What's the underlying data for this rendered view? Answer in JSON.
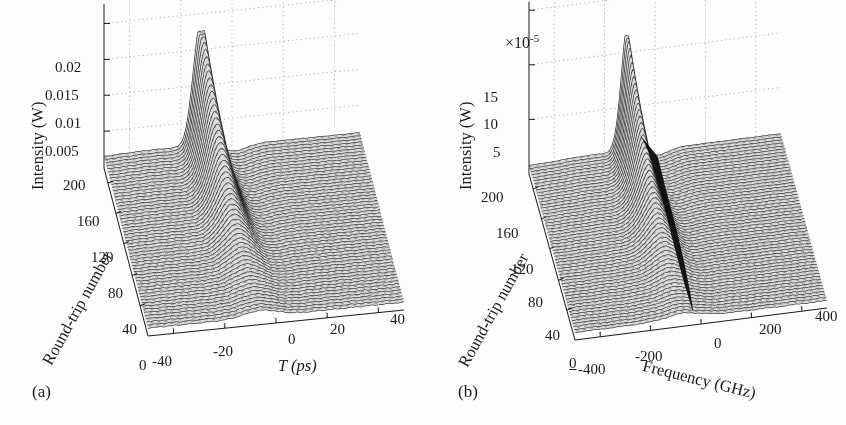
{
  "figure": {
    "background": "#fdfdfc",
    "ink": "#1a1a1a",
    "width": 846,
    "height": 425
  },
  "panels": [
    {
      "tag": "(a)",
      "multiplier": "",
      "zaxis": {
        "title": "Intensity (W)",
        "ticks": [
          "0.02",
          "0.015",
          "0.01",
          "0.005"
        ],
        "tick_values": [
          0.02,
          0.015,
          0.01,
          0.005
        ],
        "min": 0,
        "max": 0.0225
      },
      "depth_axis": {
        "title": "Round-trip number",
        "ticks": [
          "200",
          "160",
          "120",
          "80",
          "40"
        ],
        "tick_values": [
          200,
          160,
          120,
          80,
          40
        ],
        "origin_label": "0",
        "min": 0,
        "max": 220
      },
      "xaxis": {
        "title": "T (ps)",
        "ticks": [
          "-40",
          "-20",
          "0",
          "20",
          "40"
        ],
        "tick_values": [
          -40,
          -20,
          0,
          20,
          40
        ],
        "min": -50,
        "max": 50
      }
    },
    {
      "tag": "(b)",
      "multiplier": "×10",
      "multiplier_exponent": "-5",
      "zaxis": {
        "title": "Intensity (W)",
        "ticks": [
          "15",
          "10",
          "5"
        ],
        "tick_values": [
          15,
          10,
          5
        ],
        "min": 0,
        "max": 19
      },
      "depth_axis": {
        "title": "Round-trip number",
        "ticks": [
          "200",
          "160",
          "120",
          "80",
          "40"
        ],
        "tick_values": [
          200,
          160,
          120,
          80,
          40
        ],
        "origin_label": "0",
        "min": 0,
        "max": 220
      },
      "xaxis": {
        "title": "Frequency (GHz)",
        "ticks": [
          "-400",
          "-200",
          "0",
          "200",
          "400"
        ],
        "tick_values": [
          -400,
          -200,
          0,
          200,
          400
        ],
        "min": -500,
        "max": 500
      }
    }
  ],
  "chart_data": [
    {
      "type": "line",
      "panel": "(a)",
      "title": "",
      "xlabel": "T (ps)",
      "ylabel": "Round-trip number",
      "zlabel": "Intensity (W)",
      "xlim": [
        -50,
        50
      ],
      "ylim": [
        0,
        220
      ],
      "zlim": [
        0,
        0.0225
      ],
      "xticks": [
        -40,
        -20,
        0,
        20,
        40
      ],
      "yticks": [
        40,
        80,
        120,
        160,
        200
      ],
      "zticks": [
        0.005,
        0.01,
        0.015,
        0.02
      ],
      "grid": true,
      "legend": "none",
      "series_count": 55,
      "description": "Waterfall of temporal pulse intensity versus time T for successive cavity round trips; a single pulse near T = -12 ps grows from a low noisy pedestal at round trip 40 to a tall narrow peak of about 0.022 W by round trip 200, while a broad low-level background fills the rest of the window.",
      "series": [
        {
          "name": "round trip 20",
          "peak_T": -6,
          "peak_z": 0.0011,
          "pedestal": 0.0007
        },
        {
          "name": "round trip 40",
          "peak_T": -7,
          "peak_z": 0.0018,
          "pedestal": 0.0009
        },
        {
          "name": "round trip 60",
          "peak_T": -8,
          "peak_z": 0.0031,
          "pedestal": 0.0011
        },
        {
          "name": "round trip 80",
          "peak_T": -9,
          "peak_z": 0.0052,
          "pedestal": 0.0012
        },
        {
          "name": "round trip 100",
          "peak_T": -10,
          "peak_z": 0.0082,
          "pedestal": 0.0013
        },
        {
          "name": "round trip 120",
          "peak_T": -11,
          "peak_z": 0.0118,
          "pedestal": 0.0014
        },
        {
          "name": "round trip 140",
          "peak_T": -11.5,
          "peak_z": 0.0154,
          "pedestal": 0.0014
        },
        {
          "name": "round trip 160",
          "peak_T": -12,
          "peak_z": 0.0184,
          "pedestal": 0.0014
        },
        {
          "name": "round trip 180",
          "peak_T": -12,
          "peak_z": 0.0207,
          "pedestal": 0.0014
        },
        {
          "name": "round trip 200",
          "peak_T": -12,
          "peak_z": 0.022,
          "pedestal": 0.0014
        }
      ]
    },
    {
      "type": "line",
      "panel": "(b)",
      "title": "",
      "xlabel": "Frequency (GHz)",
      "ylabel": "Round-trip number",
      "zlabel": "Intensity (W)",
      "z_multiplier": 1e-05,
      "xlim": [
        -500,
        500
      ],
      "ylim": [
        0,
        220
      ],
      "zlim": [
        0,
        19
      ],
      "xticks": [
        -400,
        -200,
        0,
        200,
        400
      ],
      "yticks": [
        40,
        80,
        120,
        160,
        200
      ],
      "zticks": [
        5,
        10,
        15
      ],
      "grid": true,
      "legend": "none",
      "series_count": 55,
      "description": "Waterfall of optical spectrum versus frequency offset for successive cavity round trips; a narrow spectral line near -110 GHz sharpens and rises to about 18e-5 W by round trip 200 while the broad background spectrum stays near 1e-5 W, producing a dark steep flank on the high-frequency side.",
      "series": [
        {
          "name": "round trip 20",
          "peak_f": -70,
          "peak_z": 1.3,
          "pedestal": 0.9
        },
        {
          "name": "round trip 40",
          "peak_f": -80,
          "peak_z": 1.9,
          "pedestal": 1.0
        },
        {
          "name": "round trip 60",
          "peak_f": -90,
          "peak_z": 3.0,
          "pedestal": 1.0
        },
        {
          "name": "round trip 80",
          "peak_f": -95,
          "peak_z": 4.6,
          "pedestal": 1.05
        },
        {
          "name": "round trip 100",
          "peak_f": -100,
          "peak_z": 6.8,
          "pedestal": 1.05
        },
        {
          "name": "round trip 120",
          "peak_f": -105,
          "peak_z": 9.5,
          "pedestal": 1.1
        },
        {
          "name": "round trip 140",
          "peak_f": -108,
          "peak_z": 12.3,
          "pedestal": 1.1
        },
        {
          "name": "round trip 160",
          "peak_f": -110,
          "peak_z": 14.8,
          "pedestal": 1.1
        },
        {
          "name": "round trip 180",
          "peak_f": -110,
          "peak_z": 16.8,
          "pedestal": 1.1
        },
        {
          "name": "round trip 200",
          "peak_f": -110,
          "peak_z": 18.0,
          "pedestal": 1.1
        }
      ]
    }
  ]
}
